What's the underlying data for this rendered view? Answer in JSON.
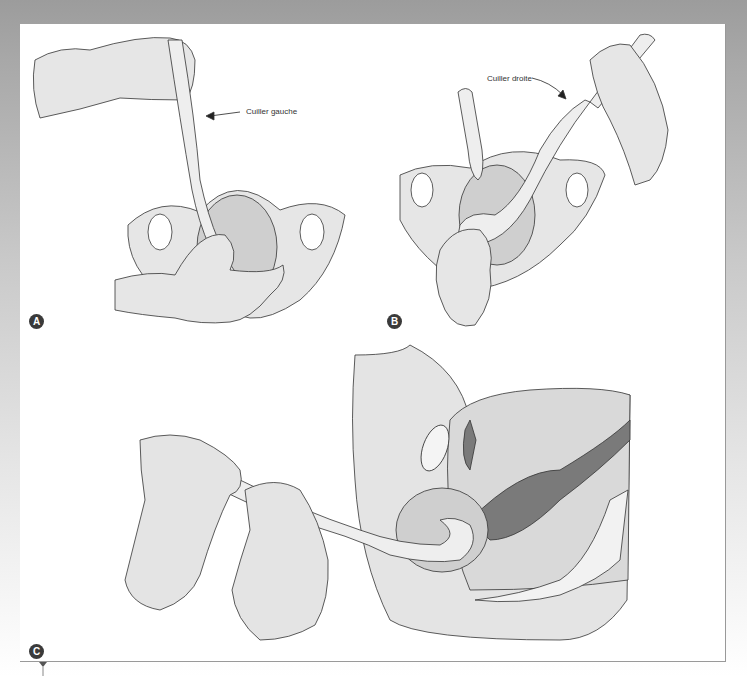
{
  "figure": {
    "panels": [
      {
        "id": "A",
        "label": "A",
        "caption": "Cuiller gauche"
      },
      {
        "id": "B",
        "label": "B",
        "caption": "Cuiller droite"
      },
      {
        "id": "C",
        "label": "C"
      }
    ]
  },
  "colors": {
    "background_top": "#9c9c9c",
    "panel": "#ffffff",
    "tissue_fill": "#e4e4e4",
    "dark_fill": "#7a7a7a",
    "line": "#333333",
    "badge": "#3a3a3a"
  }
}
